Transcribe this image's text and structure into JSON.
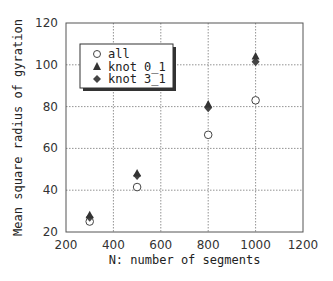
{
  "chart_data": {
    "type": "scatter",
    "title": "",
    "xlabel": "N: number of segments",
    "ylabel": "Mean square radius of gyration",
    "xlim": [
      200,
      1200
    ],
    "ylim": [
      20,
      120
    ],
    "xticks": [
      200,
      400,
      600,
      800,
      1000,
      1200
    ],
    "yticks": [
      20,
      40,
      60,
      80,
      100,
      120
    ],
    "grid": true,
    "legend_position": "upper left",
    "x": [
      300,
      500,
      800,
      1000
    ],
    "series": [
      {
        "name": "all",
        "marker": "open-circle",
        "values": [
          25,
          41.5,
          66.5,
          83
        ]
      },
      {
        "name": "knot 0_1",
        "marker": "filled-triangle",
        "values": [
          28,
          48,
          81,
          104
        ]
      },
      {
        "name": "knot 3_1",
        "marker": "filled-diamond",
        "values": [
          27,
          47,
          79.5,
          101.5
        ]
      }
    ]
  },
  "legend": {
    "items": [
      {
        "label": "all"
      },
      {
        "label": "knot 0_1"
      },
      {
        "label": "knot 3_1"
      }
    ]
  },
  "axes": {
    "x_ticks": [
      "200",
      "400",
      "600",
      "800",
      "1000",
      "1200"
    ],
    "y_ticks": [
      "20",
      "40",
      "60",
      "80",
      "100",
      "120"
    ],
    "xlabel": "N: number of segments",
    "ylabel": "Mean square radius of gyration"
  }
}
